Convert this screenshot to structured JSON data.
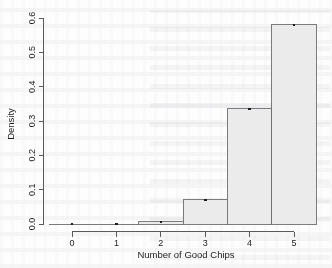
{
  "chart_data": {
    "type": "bar",
    "title": "",
    "subtitle": "",
    "xlabel": "Number of Good Chips",
    "ylabel": "Density",
    "categories": [
      "0",
      "1",
      "2",
      "3",
      "4",
      "5"
    ],
    "values": [
      0.0,
      0.0,
      0.006,
      0.07,
      0.335,
      0.58
    ],
    "x": [
      0,
      1,
      2,
      3,
      4,
      5
    ],
    "bin_edges": [
      -0.5,
      0.5,
      1.5,
      2.5,
      3.5,
      4.5,
      5.5
    ],
    "bin_width": 1,
    "xlim": [
      -0.5,
      5.5
    ],
    "ylim": [
      0.0,
      0.6
    ],
    "xticks": [
      0,
      1,
      2,
      3,
      4,
      5
    ],
    "xtick_labels": [
      "0",
      "1",
      "2",
      "3",
      "4",
      "5"
    ],
    "yticks": [
      0.0,
      0.1,
      0.2,
      0.3,
      0.4,
      0.5,
      0.6
    ],
    "ytick_labels": [
      "0.0",
      "0.1",
      "0.2",
      "0.3",
      "0.4",
      "0.5",
      "0.6"
    ],
    "grid": false,
    "legend": false,
    "legend_position": "none",
    "bar_fill": "#ebebeb",
    "bar_edge": "#6e6e6e",
    "axis_color": "#5a5a5a",
    "text_color": "#1c1c1c",
    "overlay_points": {
      "name": "point-markers",
      "marker": "square",
      "color": "#1a1a1a",
      "x": [
        0,
        1,
        2,
        3,
        4,
        5
      ],
      "y": [
        0.0,
        0.0,
        0.006,
        0.07,
        0.335,
        0.58
      ]
    },
    "annotations": []
  }
}
